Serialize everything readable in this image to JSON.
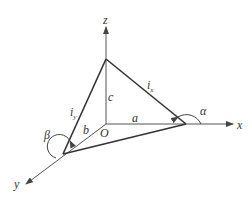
{
  "diagram": {
    "axes": {
      "x": "x",
      "y": "y",
      "z": "z"
    },
    "origin": "O",
    "intercepts": {
      "a": "a",
      "b": "b",
      "c": "c"
    },
    "edges": {
      "ix": "i",
      "ix_sub": "x",
      "iy": "i",
      "iy_sub": "y"
    },
    "angles": {
      "alpha": "α",
      "beta": "β"
    },
    "colors": {
      "line": "#333333",
      "axis": "#555555"
    }
  }
}
